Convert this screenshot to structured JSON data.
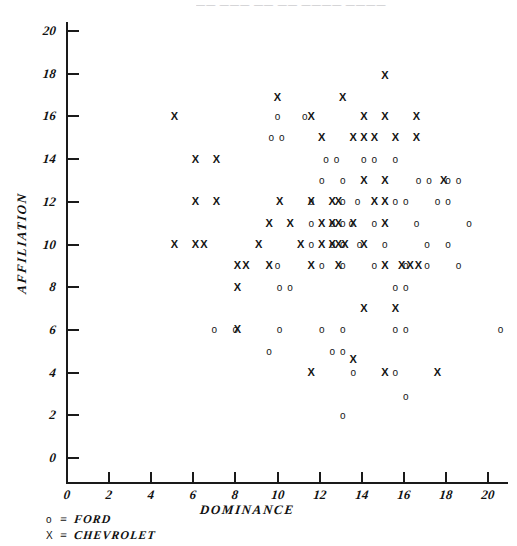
{
  "figure": {
    "title_sliver": "—— ——— —— —— ———— ————",
    "xaxis_title": "DOMINANCE",
    "yaxis_title": "AFFILIATION",
    "xticks": [
      "0",
      "2",
      "4",
      "6",
      "8",
      "10",
      "12",
      "14",
      "16",
      "18",
      "20"
    ],
    "yticks": [
      "0",
      "2",
      "4",
      "6",
      "8",
      "10",
      "12",
      "14",
      "16",
      "18",
      "20"
    ]
  },
  "legend": {
    "rows": [
      {
        "symbol": "o",
        "eq": "=",
        "label": "FORD"
      },
      {
        "symbol": "X",
        "eq": "=",
        "label": "CHEVROLET"
      }
    ]
  },
  "chart_data": {
    "type": "scatter",
    "title": "",
    "xlabel": "DOMINANCE",
    "ylabel": "AFFILIATION",
    "xlim": [
      0,
      21
    ],
    "ylim": [
      0,
      21
    ],
    "grid": false,
    "legend_position": "below-left",
    "series": [
      {
        "name": "FORD",
        "marker": "o",
        "points": [
          [
            10.0,
            16.0
          ],
          [
            11.3,
            16.0
          ],
          [
            9.7,
            15.0
          ],
          [
            10.2,
            15.0
          ],
          [
            12.3,
            14.0
          ],
          [
            12.8,
            14.0
          ],
          [
            14.1,
            14.0
          ],
          [
            14.6,
            14.0
          ],
          [
            15.6,
            14.0
          ],
          [
            12.1,
            13.0
          ],
          [
            13.1,
            13.0
          ],
          [
            16.7,
            13.0
          ],
          [
            17.2,
            13.0
          ],
          [
            18.1,
            13.0
          ],
          [
            18.6,
            13.0
          ],
          [
            11.6,
            12.0
          ],
          [
            13.1,
            12.0
          ],
          [
            13.8,
            12.0
          ],
          [
            15.6,
            12.0
          ],
          [
            16.1,
            12.0
          ],
          [
            17.6,
            12.0
          ],
          [
            18.1,
            12.0
          ],
          [
            11.6,
            11.0
          ],
          [
            12.6,
            11.0
          ],
          [
            13.1,
            11.0
          ],
          [
            13.5,
            11.0
          ],
          [
            14.6,
            11.0
          ],
          [
            16.6,
            11.0
          ],
          [
            19.1,
            11.0
          ],
          [
            11.6,
            10.0
          ],
          [
            12.6,
            10.0
          ],
          [
            13.1,
            10.0
          ],
          [
            13.9,
            10.0
          ],
          [
            15.1,
            10.0
          ],
          [
            17.1,
            10.0
          ],
          [
            18.1,
            10.0
          ],
          [
            10.0,
            9.0
          ],
          [
            12.1,
            9.0
          ],
          [
            13.1,
            9.0
          ],
          [
            14.6,
            9.0
          ],
          [
            16.1,
            9.0
          ],
          [
            17.1,
            9.0
          ],
          [
            18.6,
            9.0
          ],
          [
            10.1,
            8.0
          ],
          [
            10.6,
            8.0
          ],
          [
            15.6,
            8.0
          ],
          [
            16.1,
            8.0
          ],
          [
            7.0,
            6.0
          ],
          [
            8.0,
            6.0
          ],
          [
            10.1,
            6.0
          ],
          [
            12.1,
            6.0
          ],
          [
            13.1,
            6.0
          ],
          [
            15.6,
            6.0
          ],
          [
            16.1,
            6.0
          ],
          [
            20.6,
            6.0
          ],
          [
            9.6,
            5.0
          ],
          [
            12.6,
            5.0
          ],
          [
            13.1,
            5.0
          ],
          [
            13.6,
            4.0
          ],
          [
            15.6,
            4.0
          ],
          [
            16.1,
            2.9
          ],
          [
            13.1,
            2.0
          ]
        ]
      },
      {
        "name": "CHEVROLET",
        "marker": "X",
        "points": [
          [
            15.1,
            17.9
          ],
          [
            10.0,
            16.9
          ],
          [
            13.1,
            16.9
          ],
          [
            5.1,
            16.0
          ],
          [
            11.6,
            16.0
          ],
          [
            14.1,
            16.0
          ],
          [
            15.1,
            16.0
          ],
          [
            16.6,
            16.0
          ],
          [
            12.1,
            15.0
          ],
          [
            13.6,
            15.0
          ],
          [
            14.1,
            15.0
          ],
          [
            14.6,
            15.0
          ],
          [
            15.6,
            15.0
          ],
          [
            16.6,
            15.0
          ],
          [
            6.1,
            14.0
          ],
          [
            7.1,
            14.0
          ],
          [
            14.1,
            13.0
          ],
          [
            15.1,
            13.0
          ],
          [
            17.9,
            13.0
          ],
          [
            6.1,
            12.0
          ],
          [
            7.1,
            12.0
          ],
          [
            10.1,
            12.0
          ],
          [
            11.6,
            12.0
          ],
          [
            12.6,
            12.0
          ],
          [
            12.9,
            12.0
          ],
          [
            14.6,
            12.0
          ],
          [
            15.1,
            12.0
          ],
          [
            9.6,
            11.0
          ],
          [
            10.6,
            11.0
          ],
          [
            12.1,
            11.0
          ],
          [
            12.6,
            11.0
          ],
          [
            12.9,
            11.0
          ],
          [
            13.6,
            11.0
          ],
          [
            15.1,
            11.0
          ],
          [
            5.1,
            10.0
          ],
          [
            6.1,
            10.0
          ],
          [
            6.5,
            10.0
          ],
          [
            9.1,
            10.0
          ],
          [
            11.1,
            10.0
          ],
          [
            12.1,
            10.0
          ],
          [
            12.6,
            10.0
          ],
          [
            12.9,
            10.0
          ],
          [
            13.2,
            10.0
          ],
          [
            14.1,
            10.0
          ],
          [
            8.1,
            9.0
          ],
          [
            8.5,
            9.0
          ],
          [
            9.6,
            9.0
          ],
          [
            11.6,
            9.0
          ],
          [
            12.9,
            9.0
          ],
          [
            15.1,
            9.0
          ],
          [
            15.9,
            9.0
          ],
          [
            16.3,
            9.0
          ],
          [
            16.7,
            9.0
          ],
          [
            8.1,
            8.0
          ],
          [
            14.1,
            7.0
          ],
          [
            15.6,
            7.0
          ],
          [
            8.1,
            6.0
          ],
          [
            13.6,
            4.6
          ],
          [
            11.6,
            4.0
          ],
          [
            15.1,
            4.0
          ],
          [
            17.6,
            4.0
          ]
        ]
      }
    ]
  }
}
